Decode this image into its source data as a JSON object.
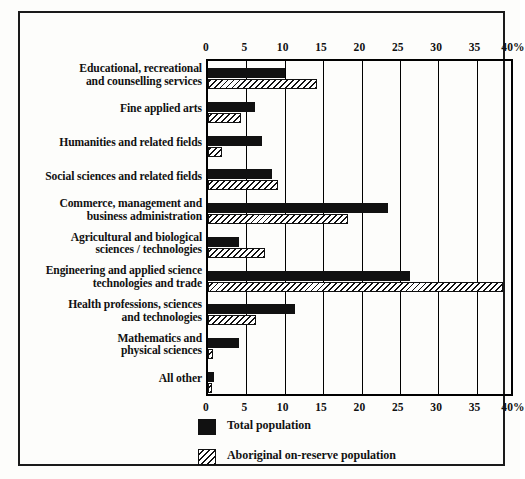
{
  "chart_data": {
    "type": "bar",
    "orientation": "horizontal",
    "title": "",
    "xlabel": "",
    "ylabel": "",
    "xlim": [
      0,
      40
    ],
    "xticks": [
      0,
      5,
      10,
      15,
      20,
      25,
      30,
      35,
      40
    ],
    "xtick_labels": [
      "0",
      "5",
      "10",
      "15",
      "20",
      "25",
      "30",
      "35",
      "40%"
    ],
    "axis_top": true,
    "axis_bottom": true,
    "grid": true,
    "legend_position": "bottom-left",
    "categories": [
      "Educational, recreational and counselling services",
      "Fine applied arts",
      "Humanities and related fields",
      "Social sciences and related fields",
      "Commerce, management and business administration",
      "Agricultural and biological sciences / technologies",
      "Engineering and applied science technologies and trade",
      "Health professions, sciences and technologies",
      "Mathematics and physical sciences",
      "All other"
    ],
    "category_lines": [
      [
        "Educational, recreational",
        "and counselling services"
      ],
      [
        "Fine applied arts"
      ],
      [
        "Humanities and related fields"
      ],
      [
        "Social sciences and related fields"
      ],
      [
        "Commerce, management and",
        "business administration"
      ],
      [
        "Agricultural and biological",
        "sciences / technologies"
      ],
      [
        "Engineering and applied science",
        "technologies and trade"
      ],
      [
        "Health professions, sciences",
        "and technologies"
      ],
      [
        "Mathematics and",
        "physical sciences"
      ],
      [
        "All other"
      ]
    ],
    "series": [
      {
        "name": "Total population",
        "fill": "solid",
        "color": "#111111",
        "values": [
          10.0,
          6.1,
          7.1,
          8.4,
          23.4,
          4.1,
          26.3,
          11.3,
          4.1,
          0.8
        ]
      },
      {
        "name": "Aboriginal on-reserve population",
        "fill": "hatched",
        "color": "#111111",
        "values": [
          14.2,
          4.3,
          1.8,
          9.1,
          18.3,
          7.4,
          38.5,
          6.3,
          0.7,
          0.5
        ]
      }
    ]
  },
  "legend": {
    "items": [
      {
        "label": "Total population",
        "fill": "solid"
      },
      {
        "label": "Aboriginal on-reserve population",
        "fill": "hatched"
      }
    ]
  }
}
